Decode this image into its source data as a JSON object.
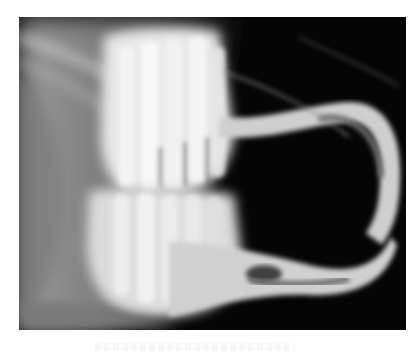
{
  "image": {
    "kind": "radiograph",
    "subject": "lateral x-ray of animal skull showing molars and elongated curved incisors",
    "colors": {
      "background": "#ffffff",
      "film_dark": "#050505",
      "bone_bright": "#f2f2f2",
      "soft_tissue": "#8a8a8a"
    }
  }
}
